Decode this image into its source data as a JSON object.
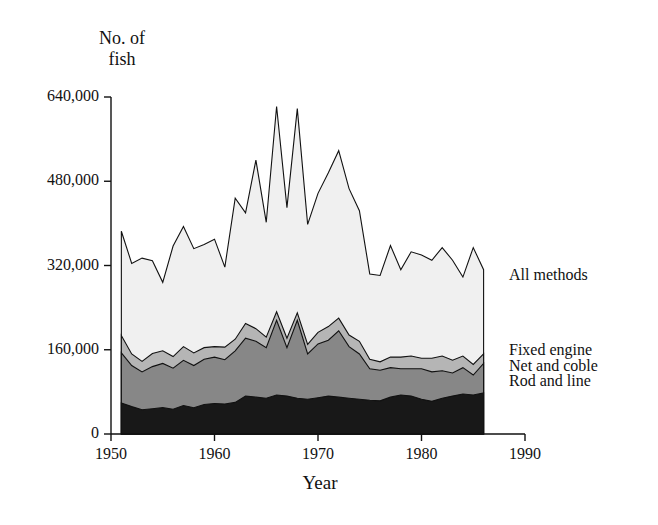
{
  "chart_data": {
    "type": "area",
    "stacked": true,
    "title": "",
    "ylabel": "No. of\nfish",
    "xlabel": "Year",
    "xlim": [
      1950,
      1990
    ],
    "ylim": [
      0,
      640000
    ],
    "grid": false,
    "legend_position": "right-inline",
    "x_ticks": [
      1950,
      1960,
      1970,
      1980,
      1990
    ],
    "x_tick_labels": [
      "1950",
      "1960",
      "1970",
      "1980",
      "1990"
    ],
    "y_ticks": [
      0,
      160000,
      320000,
      480000,
      640000
    ],
    "y_tick_labels": [
      "0",
      "160,000",
      "320,000",
      "480,000",
      "640,000"
    ],
    "x": [
      1951,
      1952,
      1953,
      1954,
      1955,
      1956,
      1957,
      1958,
      1959,
      1960,
      1961,
      1962,
      1963,
      1964,
      1965,
      1966,
      1967,
      1968,
      1969,
      1970,
      1971,
      1972,
      1973,
      1974,
      1975,
      1976,
      1977,
      1978,
      1979,
      1980,
      1981,
      1982,
      1983,
      1984,
      1985,
      1986
    ],
    "series": [
      {
        "name": "Rod and line",
        "color": "#181818",
        "values": [
          59000,
          52000,
          46000,
          48000,
          50000,
          47000,
          54000,
          50000,
          56000,
          58000,
          57000,
          60000,
          72000,
          70000,
          68000,
          74000,
          72000,
          68000,
          66000,
          69000,
          72000,
          70000,
          68000,
          66000,
          64000,
          63000,
          70000,
          74000,
          72000,
          66000,
          62000,
          68000,
          72000,
          76000,
          74000,
          78000
        ]
      },
      {
        "name": "Net and coble",
        "color": "#878787",
        "values": [
          95000,
          78000,
          72000,
          80000,
          84000,
          78000,
          86000,
          80000,
          86000,
          88000,
          84000,
          98000,
          110000,
          106000,
          96000,
          142000,
          92000,
          148000,
          86000,
          102000,
          106000,
          126000,
          98000,
          86000,
          60000,
          58000,
          56000,
          50000,
          52000,
          58000,
          56000,
          52000,
          44000,
          50000,
          38000,
          56000
        ]
      },
      {
        "name": "Fixed engine",
        "color": "#b5b5b5",
        "values": [
          33000,
          22000,
          20000,
          25000,
          24000,
          22000,
          26000,
          24000,
          22000,
          20000,
          24000,
          22000,
          28000,
          24000,
          20000,
          16000,
          18000,
          14000,
          18000,
          22000,
          26000,
          24000,
          22000,
          24000,
          18000,
          16000,
          20000,
          22000,
          24000,
          20000,
          26000,
          28000,
          24000,
          22000,
          20000,
          18000
        ]
      },
      {
        "name": "All methods",
        "color": "#f0f0f0",
        "values": [
          198000,
          172000,
          196000,
          176000,
          130000,
          210000,
          228000,
          198000,
          196000,
          204000,
          152000,
          268000,
          210000,
          320000,
          218000,
          390000,
          248000,
          388000,
          228000,
          264000,
          292000,
          318000,
          278000,
          248000,
          162000,
          164000,
          212000,
          166000,
          198000,
          196000,
          186000,
          206000,
          190000,
          150000,
          222000,
          160000
        ]
      }
    ],
    "series_totals": [
      385000,
      324000,
      334000,
      329000,
      288000,
      357000,
      394000,
      352000,
      360000,
      370000,
      317000,
      448000,
      420000,
      520000,
      402000,
      622000,
      430000,
      618000,
      398000,
      457000,
      496000,
      538000,
      466000,
      424000,
      304000,
      301000,
      358000,
      312000,
      346000,
      340000,
      330000,
      354000,
      330000,
      298000,
      354000,
      312000
    ],
    "annotations": [
      {
        "label": "All methods",
        "x": 1990,
        "y": 300000
      },
      {
        "label": "Fixed engine",
        "x": 1990,
        "y": 158000
      },
      {
        "label": "Net and coble",
        "x": 1990,
        "y": 128000
      },
      {
        "label": "Rod and line",
        "x": 1990,
        "y": 98000
      }
    ]
  }
}
